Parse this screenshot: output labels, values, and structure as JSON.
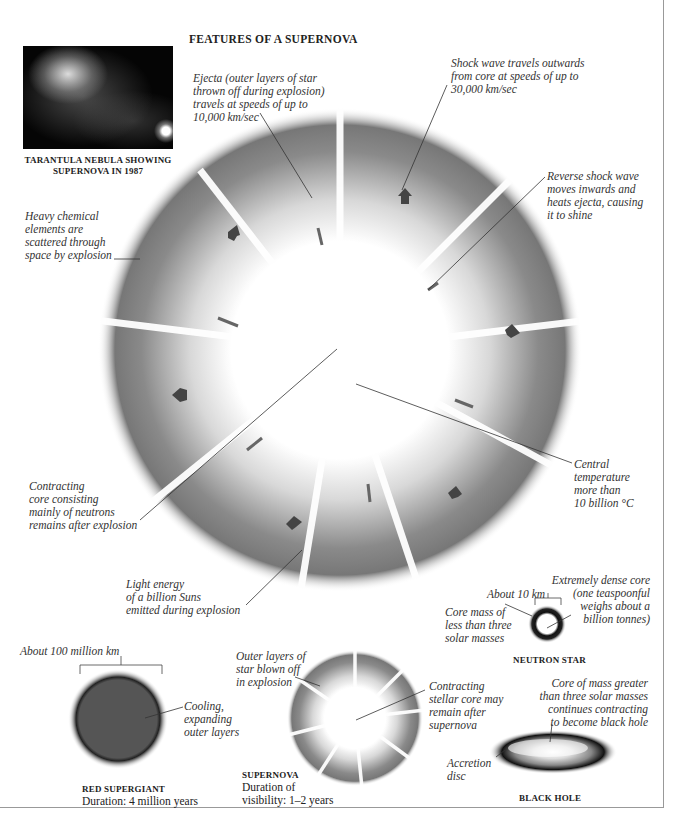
{
  "title": "FEATURES OF A SUPERNOVA",
  "photo": {
    "caption_line1": "TARANTULA NEBULA SHOWING",
    "caption_line2": "SUPERNOVA IN 1987"
  },
  "main_labels": {
    "ejecta": [
      "Ejecta (outer layers of star",
      "thrown off during explosion)",
      "travels at speeds of up to",
      "10,000 km/sec"
    ],
    "shock_wave": [
      "Shock wave travels outwards",
      "from core at speeds of up to",
      "30,000 km/sec"
    ],
    "reverse_shock": [
      "Reverse shock wave",
      "moves inwards and",
      "heats ejecta, causing",
      "it to shine"
    ],
    "heavy_elements": [
      "Heavy chemical",
      "elements are",
      "scattered through",
      "space by explosion"
    ],
    "contracting_core": [
      "Contracting",
      "core consisting",
      "mainly of neutrons",
      "remains after explosion"
    ],
    "central_temp": [
      "Central",
      "temperature",
      "more than",
      "10 billion °C"
    ],
    "light_energy": [
      "Light energy",
      "of a billion Suns",
      "emitted during explosion"
    ]
  },
  "neutron_star": {
    "size_label": "About 10 km",
    "core_mass": [
      "Core mass of",
      "less than three",
      "solar masses"
    ],
    "dense_core": [
      "Extremely dense core",
      "(one teaspoonful",
      "weighs about a",
      "billion tonnes)"
    ],
    "caption": "NEUTRON STAR"
  },
  "red_supergiant": {
    "size_label": "About 100 million km",
    "layers_label": [
      "Cooling,",
      "expanding",
      "outer layers"
    ],
    "caption": "RED SUPERGIANT",
    "duration": "Duration: 4 million years",
    "color": "#555555"
  },
  "supernova_small": {
    "outer_layers": [
      "Outer layers of",
      "star blown off",
      "in explosion"
    ],
    "core_label": [
      "Contracting",
      "stellar core may",
      "remain after",
      "supernova"
    ],
    "caption": "SUPERNOVA",
    "duration_line1": "Duration of",
    "duration_line2": "visibility: 1–2 years"
  },
  "black_hole": {
    "core_label": [
      "Core of mass greater",
      "than three solar masses",
      "continues contracting",
      "to become black hole"
    ],
    "disc_label": [
      "Accretion",
      "disc"
    ],
    "caption": "BLACK HOLE"
  }
}
